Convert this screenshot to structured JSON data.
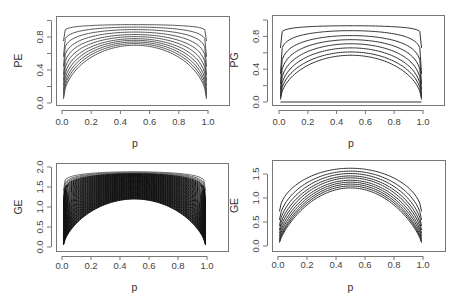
{
  "chart_data": [
    {
      "type": "line",
      "id": "pe",
      "title": "",
      "xlabel": "p",
      "ylabel": "PE",
      "xlim": [
        0.0,
        1.0
      ],
      "ylim": [
        0.0,
        1.0
      ],
      "xticks": [
        "0.0",
        "0.2",
        "0.4",
        "0.6",
        "0.8",
        "1.0"
      ],
      "yticks": [
        "0.0",
        "0.4",
        "0.8"
      ],
      "grid": false,
      "legend": null,
      "x_range_plotted": [
        0.01,
        0.99
      ],
      "series_description": "Family of ~11 concave curves symmetric about p=0.5; peaks range from ~0.95 (top, flattest) down to ~0.70; endpoint values range from ~0.75 down to ~0.05",
      "series": [
        {
          "name": "curve 1",
          "peak": 0.95,
          "end": 0.75
        },
        {
          "name": "curve 2",
          "peak": 0.92,
          "end": 0.56
        },
        {
          "name": "curve 3",
          "peak": 0.89,
          "end": 0.44
        },
        {
          "name": "curve 4",
          "peak": 0.86,
          "end": 0.34
        },
        {
          "name": "curve 5",
          "peak": 0.83,
          "end": 0.27
        },
        {
          "name": "curve 6",
          "peak": 0.805,
          "end": 0.21
        },
        {
          "name": "curve 7",
          "peak": 0.78,
          "end": 0.16
        },
        {
          "name": "curve 8",
          "peak": 0.76,
          "end": 0.12
        },
        {
          "name": "curve 9",
          "peak": 0.74,
          "end": 0.09
        },
        {
          "name": "curve 10",
          "peak": 0.72,
          "end": 0.07
        },
        {
          "name": "curve 11",
          "peak": 0.7,
          "end": 0.05
        }
      ]
    },
    {
      "type": "line",
      "id": "pg",
      "title": "",
      "xlabel": "p",
      "ylabel": "PG",
      "xlim": [
        0.0,
        1.0
      ],
      "ylim": [
        0.0,
        1.0
      ],
      "xticks": [
        "0.0",
        "0.2",
        "0.4",
        "0.6",
        "0.8",
        "1.0"
      ],
      "yticks": [
        "0.0",
        "0.4",
        "0.8"
      ],
      "grid": false,
      "legend": null,
      "x_range_plotted": [
        0.01,
        0.99
      ],
      "series_description": "Family of ~8 concave curves plus a flat line at 0; peaks from ~0.93 down to ~0.57; curves drop steeply to ~0 at the endpoints",
      "series": [
        {
          "name": "curve 1",
          "peak": 0.93,
          "end": 0.66
        },
        {
          "name": "curve 2",
          "peak": 0.87,
          "end": 0.34
        },
        {
          "name": "curve 3",
          "peak": 0.81,
          "end": 0.22
        },
        {
          "name": "curve 4",
          "peak": 0.76,
          "end": 0.15
        },
        {
          "name": "curve 5",
          "peak": 0.71,
          "end": 0.1
        },
        {
          "name": "curve 6",
          "peak": 0.66,
          "end": 0.07
        },
        {
          "name": "curve 7",
          "peak": 0.61,
          "end": 0.05
        },
        {
          "name": "curve 8",
          "peak": 0.57,
          "end": 0.03
        },
        {
          "name": "baseline",
          "peak": 0.0,
          "end": 0.0
        }
      ]
    },
    {
      "type": "line",
      "id": "ge_dense",
      "title": "",
      "xlabel": "p",
      "ylabel": "GE",
      "xlim": [
        0.0,
        1.0
      ],
      "ylim": [
        0.0,
        2.0
      ],
      "xticks": [
        "0.0",
        "0.2",
        "0.4",
        "0.6",
        "0.8",
        "1.0"
      ],
      "yticks": [
        "0.0",
        "0.5",
        "1.0",
        "1.5",
        "2.0"
      ],
      "grid": false,
      "legend": null,
      "x_range_plotted": [
        0.01,
        0.99
      ],
      "series_description": "Very dense family of many (~60) concave curves forming a near-solid black band; top curve peaks ~1.88 with endpoint ~1.4; bottom curve peaks ~1.2 with endpoint ~0.05",
      "dense_count": 60,
      "series": [
        {
          "name": "top curve",
          "peak": 1.88,
          "end": 1.4
        },
        {
          "name": "bottom curve",
          "peak": 1.2,
          "end": 0.05
        }
      ]
    },
    {
      "type": "line",
      "id": "ge",
      "title": "",
      "xlabel": "p",
      "ylabel": "GE",
      "xlim": [
        0.0,
        1.0
      ],
      "ylim": [
        0.0,
        1.65
      ],
      "xticks": [
        "0.0",
        "0.2",
        "0.4",
        "0.6",
        "0.8",
        "1.0"
      ],
      "yticks": [
        "0.0",
        "0.5",
        "1.0",
        "1.5"
      ],
      "grid": false,
      "legend": null,
      "x_range_plotted": [
        0.01,
        0.99
      ],
      "series_description": "Family of ~10 concave parabola-like curves symmetric about p=0.5; peaks from ~1.62 down to ~1.20; endpoints from ~0.72 down to ~0.07",
      "series": [
        {
          "name": "curve 1",
          "peak": 1.62,
          "end": 0.72
        },
        {
          "name": "curve 2",
          "peak": 1.56,
          "end": 0.54
        },
        {
          "name": "curve 3",
          "peak": 1.51,
          "end": 0.42
        },
        {
          "name": "curve 4",
          "peak": 1.46,
          "end": 0.33
        },
        {
          "name": "curve 5",
          "peak": 1.42,
          "end": 0.26
        },
        {
          "name": "curve 6",
          "peak": 1.37,
          "end": 0.2
        },
        {
          "name": "curve 7",
          "peak": 1.33,
          "end": 0.15
        },
        {
          "name": "curve 8",
          "peak": 1.29,
          "end": 0.11
        },
        {
          "name": "curve 9",
          "peak": 1.25,
          "end": 0.09
        },
        {
          "name": "curve 10",
          "peak": 1.21,
          "end": 0.07
        }
      ]
    }
  ],
  "panels": [
    {
      "ylabel": "PE",
      "xlabel": "p",
      "box": {
        "x0": 56,
        "y0": 16,
        "x1": 229,
        "y1": 105
      },
      "px": {
        "x0": 62,
        "x1": 208,
        "y0": 103,
        "ytop": 20.5
      },
      "yticks": [
        {
          "v": 0.0,
          "label": "0.0"
        },
        {
          "v": 0.4,
          "label": "0.4"
        },
        {
          "v": 0.8,
          "label": "0.8"
        }
      ],
      "yminor": [
        0.2,
        0.6,
        1.0
      ],
      "ymax": 1.0,
      "stroke": "#555555",
      "label_y": 122,
      "p_y": 143
    },
    {
      "ylabel": "PG",
      "xlabel": "p",
      "box": {
        "x0": 272,
        "y0": 15,
        "x1": 444,
        "y1": 105
      },
      "px": {
        "x0": 279,
        "x1": 423,
        "y0": 102,
        "ytop": 20
      },
      "yticks": [
        {
          "v": 0.0,
          "label": "0.0"
        },
        {
          "v": 0.4,
          "label": "0.4"
        },
        {
          "v": 0.8,
          "label": "0.8"
        }
      ],
      "yminor": [
        0.2,
        0.6,
        1.0
      ],
      "ymax": 1.0,
      "stroke": "#333333",
      "label_y": 122,
      "p_y": 143
    },
    {
      "ylabel": "GE",
      "xlabel": "p",
      "box": {
        "x0": 56,
        "y0": 163,
        "x1": 228,
        "y1": 251
      },
      "px": {
        "x0": 62,
        "x1": 207,
        "y0": 247,
        "ytop": 167
      },
      "yticks": [
        {
          "v": 0.0,
          "label": "0.0"
        },
        {
          "v": 0.5,
          "label": "0.5"
        },
        {
          "v": 1.0,
          "label": "1.0"
        },
        {
          "v": 1.5,
          "label": "1.5"
        },
        {
          "v": 2.0,
          "label": "2.0"
        }
      ],
      "yminor": [],
      "ymax": 2.0,
      "stroke": "#111111",
      "label_y": 266,
      "p_y": 287
    },
    {
      "ylabel": "GE",
      "xlabel": "p",
      "box": {
        "x0": 272,
        "y0": 160,
        "x1": 445,
        "y1": 251
      },
      "px": {
        "x0": 278,
        "x1": 423,
        "y0": 246,
        "ytop": 174
      },
      "yticks": [
        {
          "v": 0.0,
          "label": "0.0"
        },
        {
          "v": 0.5,
          "label": "0.5"
        },
        {
          "v": 1.0,
          "label": "1.0"
        },
        {
          "v": 1.5,
          "label": "1.5"
        }
      ],
      "yminor": [],
      "ymax": 1.5,
      "stroke": "#333333",
      "label_y": 265,
      "p_y": 287
    }
  ],
  "xticks": [
    "0.0",
    "0.2",
    "0.4",
    "0.6",
    "0.8",
    "1.0"
  ]
}
